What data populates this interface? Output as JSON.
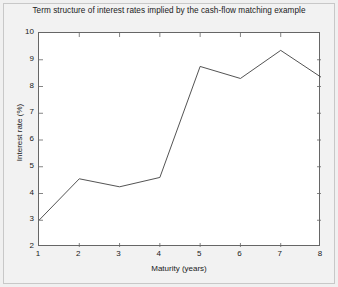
{
  "chart_data": {
    "type": "line",
    "title": "Term structure of interest rates implied by the cash-flow matching example",
    "xlabel": "Maturity (years)",
    "ylabel": "Interest rate (%)",
    "x": [
      1,
      2,
      3,
      4,
      5,
      6,
      7,
      8
    ],
    "values": [
      3.0,
      4.55,
      4.25,
      4.6,
      8.75,
      8.3,
      9.35,
      8.35
    ],
    "series": [
      {
        "name": "Implied interest rate",
        "values": [
          3.0,
          4.55,
          4.25,
          4.6,
          8.75,
          8.3,
          9.35,
          8.35
        ]
      }
    ],
    "xlim": [
      1,
      8
    ],
    "ylim": [
      2,
      10
    ],
    "xticks": [
      1,
      2,
      3,
      4,
      5,
      6,
      7,
      8
    ],
    "yticks": [
      2,
      3,
      4,
      5,
      6,
      7,
      8,
      9,
      10
    ],
    "xtick_labels": [
      "1",
      "2",
      "3",
      "4",
      "5",
      "6",
      "7",
      "8"
    ],
    "ytick_labels": [
      "2",
      "3",
      "4",
      "5",
      "6",
      "7",
      "8",
      "9",
      "10"
    ],
    "grid": false,
    "legend": null,
    "legend_position": "none",
    "line_color": "#404040",
    "background_color": "#ffffff",
    "figure_background_color": "#f2f2f2",
    "markers": false
  }
}
